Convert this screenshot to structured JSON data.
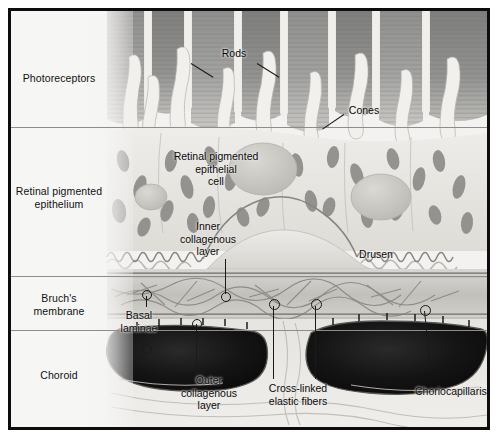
{
  "figure": {
    "type": "histological-illustration",
    "palette": {
      "border": "#0d0d0d",
      "background": "#f4f4f3",
      "divider": "#8d8d8d",
      "text": "#0a0a0a",
      "leader": "#1a1a1a",
      "photoreceptor_segment": "#9a9a98",
      "rpe_cytoplasm": "#e8e6e2",
      "melanosome": "#8e8c8a",
      "bruch_membrane": "#b9b7b3",
      "choriocapillaris_lumen": "#141414"
    }
  },
  "layer_labels": [
    {
      "id": "photoreceptors",
      "text": "Photoreceptors"
    },
    {
      "id": "retinal-pigmented-epithelium",
      "text": "Retinal pigmented\nepithelium"
    },
    {
      "id": "bruchs-membrane",
      "text": "Bruch's\nmembrane"
    },
    {
      "id": "choroid",
      "text": "Choroid"
    }
  ],
  "callouts": [
    {
      "id": "rods",
      "text": "Rods"
    },
    {
      "id": "cones",
      "text": "Cones"
    },
    {
      "id": "retinal-pigmented-epithelial-cell",
      "text": "Retinal pigmented\nepithelial\ncell"
    },
    {
      "id": "inner-collagenous-layer",
      "text": "Inner\ncollagenous\nlayer"
    },
    {
      "id": "drusen",
      "text": "Drusen"
    },
    {
      "id": "basal-laminae",
      "text": "Basal\nlaminae"
    },
    {
      "id": "outer-collagenous-layer",
      "text": "Outer\ncollagenous\nlayer"
    },
    {
      "id": "cross-linked-elastic-fibers",
      "text": "Cross-linked\nelastic fibers"
    },
    {
      "id": "choriocapillaris",
      "text": "Choriocapillaris"
    }
  ]
}
